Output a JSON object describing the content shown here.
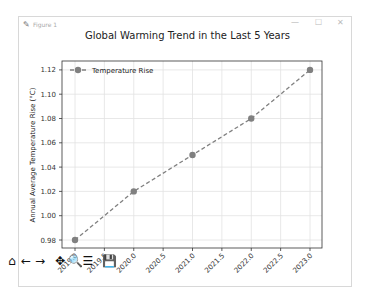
{
  "window": {
    "title": "Figure 1",
    "controls": {
      "minimize": "—",
      "maximize": "☐",
      "close": "✕"
    }
  },
  "toolbar": {
    "items": [
      {
        "name": "home-icon",
        "glyph": "⌂"
      },
      {
        "name": "back-icon",
        "glyph": "←"
      },
      {
        "name": "forward-icon",
        "glyph": "→"
      },
      {
        "name": "pan-icon",
        "glyph": "✥"
      },
      {
        "name": "zoom-icon",
        "glyph": "🔍"
      },
      {
        "name": "configure-subplots-icon",
        "glyph": "☰"
      },
      {
        "name": "save-icon",
        "glyph": "💾"
      }
    ]
  },
  "chart_data": {
    "type": "line",
    "title": "Global Warming Trend in the Last 5 Years",
    "xlabel": "",
    "ylabel": "Annual Average Temperature Rise (°C)",
    "x": [
      2019,
      2020,
      2021,
      2022,
      2023
    ],
    "series": [
      {
        "name": "Temperature Rise",
        "values": [
          0.98,
          1.02,
          1.05,
          1.08,
          1.12
        ],
        "color": "#808080",
        "linestyle": "dashed",
        "marker": "o"
      }
    ],
    "xticks": [
      "2019.0",
      "2019.5",
      "2020.0",
      "2020.5",
      "2021.0",
      "2021.5",
      "2022.0",
      "2022.5",
      "2023.0"
    ],
    "yticks": [
      "0.98",
      "1.00",
      "1.02",
      "1.04",
      "1.06",
      "1.08",
      "1.10",
      "1.12"
    ],
    "xlim": [
      2018.8,
      2023.2
    ],
    "ylim": [
      0.973,
      1.127
    ],
    "grid": true,
    "legend_position": "upper left"
  }
}
